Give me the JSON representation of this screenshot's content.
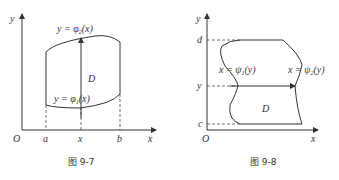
{
  "figures": [
    {
      "caption": "图 9-7",
      "labels": {
        "y_axis": "y",
        "x_axis": "x",
        "origin": "O",
        "a": "a",
        "x": "x",
        "b": "b",
        "region": "D",
        "upper_pre": "y = φ",
        "upper_sub": "2",
        "upper_post": "(x)",
        "lower_pre": "y = φ",
        "lower_sub": "1",
        "lower_post": "(x)"
      }
    },
    {
      "caption": "图 9-8",
      "labels": {
        "y_axis": "y",
        "x_axis": "x",
        "origin": "O",
        "d": "d",
        "y": "y",
        "c": "c",
        "region": "D",
        "left_pre": "x = ψ",
        "left_sub": "1",
        "left_post": "(y)",
        "right_pre": "x = ψ",
        "right_sub": "2",
        "right_post": "(y)"
      }
    }
  ]
}
